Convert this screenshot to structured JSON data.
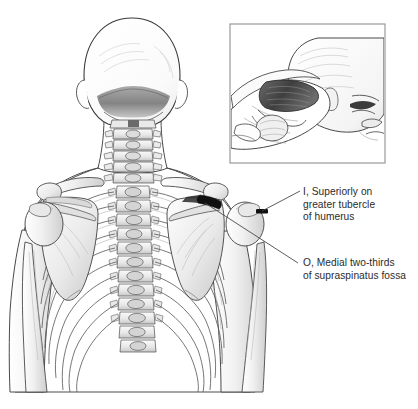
{
  "figure": {
    "view": "posterior",
    "background_color": "#ffffff",
    "width": 418,
    "height": 409
  },
  "labels": {
    "insertion": {
      "text": "I, Superiorly on\ngreater tubercle\nof humerus",
      "line1": "I, Superiorly on",
      "line2": "greater tubercle",
      "line3": "of humerus",
      "marker": "I",
      "meaning": "Insertion"
    },
    "origin": {
      "text": "O, Medial two-thirds\nof supraspinatus fossa",
      "line1": "O, Medial two-thirds",
      "line2": "of supraspinatus fossa",
      "marker": "O",
      "meaning": "Origin"
    }
  },
  "inset": {
    "name": "lateral-view-supraspinatus",
    "description": "Lateral view of head and shoulder with supraspinatus muscle exposed beneath trapezius",
    "border_color": "#9a9a9a"
  },
  "highlights": {
    "supraspinatus_fossa": {
      "name": "supraspinatus-fossa-highlight",
      "color": "#111111"
    },
    "greater_tubercle": {
      "name": "greater-tubercle-highlight",
      "color": "#111111"
    }
  },
  "colors": {
    "outline": "#3a3a3a",
    "bone_light": "#f2f2f2",
    "bone_shade": "#d9d9d9",
    "bone_shade_deep": "#b9b9b9",
    "skin_outline": "#4a4a4a",
    "muscle_dark": "#4e4e4e",
    "leader_line": "#4a4a4a",
    "text": "#2b2b2b"
  },
  "leader_lines": [
    {
      "name": "leader-line-insertion",
      "from": "greater tubercle of humerus",
      "to": "insertion label"
    },
    {
      "name": "leader-line-origin",
      "from": "supraspinatus fossa",
      "to": "origin label"
    }
  ]
}
